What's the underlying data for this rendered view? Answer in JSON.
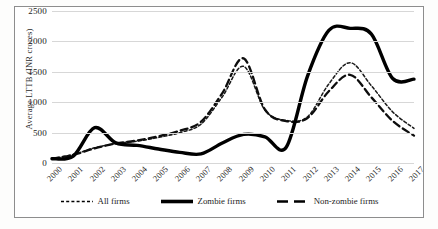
{
  "chart_data": {
    "type": "line",
    "title": "",
    "xlabel": "",
    "ylabel": "Average LTTB (INR crores)",
    "ylim": [
      0,
      2500
    ],
    "yticks": [
      0,
      500,
      1000,
      1500,
      2000,
      2500
    ],
    "grid": true,
    "legend_position": "bottom",
    "x": [
      2000,
      2001,
      2002,
      2003,
      2004,
      2005,
      2006,
      2007,
      2008,
      2009,
      2010,
      2011,
      2012,
      2013,
      2014,
      2015,
      2016,
      2017
    ],
    "categories": [
      "2000",
      "2001",
      "2002",
      "2003",
      "2004",
      "2005",
      "2006",
      "2007",
      "2008",
      "2009",
      "2010",
      "2011",
      "2012",
      "2013",
      "2014",
      "2015",
      "2016",
      "2017"
    ],
    "series": [
      {
        "name": "All firms",
        "style": "dotted",
        "color": "#1a1a1a",
        "values": [
          70,
          140,
          250,
          320,
          360,
          420,
          500,
          640,
          1090,
          1590,
          870,
          700,
          760,
          1300,
          1650,
          1270,
          840,
          570
        ]
      },
      {
        "name": "Zombie firms",
        "style": "solid",
        "color": "#000000",
        "values": [
          70,
          115,
          580,
          330,
          290,
          230,
          175,
          150,
          330,
          470,
          430,
          260,
          1430,
          2180,
          2215,
          2120,
          1390,
          1380
        ]
      },
      {
        "name": "Non-zombie firms",
        "style": "dashed",
        "color": "#0d0d0d",
        "values": [
          70,
          135,
          240,
          320,
          370,
          440,
          530,
          680,
          1150,
          1720,
          880,
          690,
          740,
          1180,
          1450,
          1080,
          690,
          450
        ]
      }
    ]
  },
  "y_axis": {
    "title": "Average LTTB (INR crores)",
    "ticks": [
      "0",
      "500",
      "1000",
      "1500",
      "2000",
      "2500"
    ]
  },
  "legend": {
    "items": [
      {
        "label": "All firms",
        "style": "dotted"
      },
      {
        "label": "Zombie firms",
        "style": "solid"
      },
      {
        "label": "Non-zombie firms",
        "style": "dashed"
      }
    ]
  }
}
